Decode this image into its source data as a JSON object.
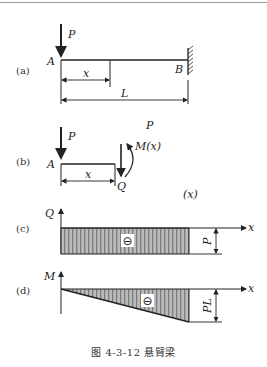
{
  "figure": {
    "caption": "图 4-3-12  悬臂梁",
    "panels": {
      "a": {
        "tag": "(a)",
        "load_label": "P",
        "left_end_label": "A",
        "right_end_label": "B",
        "section_dim_label": "x",
        "length_dim_label": "L"
      },
      "b": {
        "tag": "(b)",
        "load_label": "P",
        "left_end_label": "A",
        "section_dim_label": "x",
        "shear_label": "Q",
        "moment_label": "M(x)",
        "stray_label_p": "P",
        "stray_label_x": "(x)"
      },
      "c": {
        "tag": "(c)",
        "axis_y_label": "Q",
        "axis_x_label": "x",
        "sign_symbol": "⊖",
        "magnitude_label": "P"
      },
      "d": {
        "tag": "(d)",
        "axis_y_label": "M",
        "axis_x_label": "x",
        "sign_symbol": "⊖",
        "magnitude_label": "PL"
      }
    }
  },
  "colors": {
    "line": "#222222",
    "hatch_dark": "#8a8a8a",
    "hatch_light": "#c8c8c8",
    "fill_base": "#a9a9a9"
  }
}
